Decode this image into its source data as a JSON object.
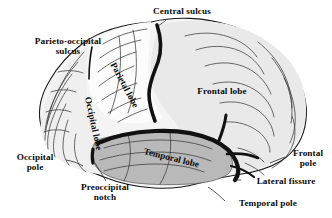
{
  "figure": {
    "background_color": "#ffffff",
    "label_color": "#0a0a0a"
  },
  "labels": {
    "central_sulcus": "Central sulcus",
    "parieto_occipital_sulcus": "Parieto-occipital\nsulcus",
    "frontal_lobe": "Frontal lobe",
    "parietal_lobe": "Parietal lobe",
    "occipital_lobe": "Occipital lobe",
    "temporal_lobe": "Temporal lobe",
    "occipital_pole": "Occipital\npole",
    "preoccipital_notch": "Preoccipital\nnotch",
    "frontal_pole": "Frontal\npole",
    "lateral_fissure": "Lateral fissure",
    "temporal_pole": "Temporal pole"
  },
  "regions": {
    "frontal_lobe_fill": "#e9e9e9",
    "parietal_lobe_fill": "#fcfcfc",
    "occipital_lobe_fill": "#efefef",
    "temporal_lobe_fill": "#b9b9b9",
    "sulcus_stroke": "#111111",
    "gyrus_stroke": "#3a3a3a"
  }
}
